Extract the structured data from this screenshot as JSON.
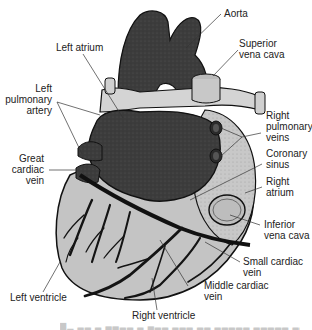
{
  "diagram": {
    "colors": {
      "dark_chamber": "#3c3c3c",
      "vessel_light": "#c9c9c9",
      "ventricle_fill": "#c4c4c4",
      "vein_dark": "#141414",
      "leader_line": "#333333",
      "background": "#ffffff"
    },
    "labels": {
      "aorta": "Aorta",
      "superior_vena_cava_1": "Superior",
      "superior_vena_cava_2": "vena cava",
      "left_atrium": "Left atrium",
      "left_pulmonary_artery_1": "Left",
      "left_pulmonary_artery_2": "pulmonary",
      "left_pulmonary_artery_3": "artery",
      "right_pulmonary_veins_1": "Right",
      "right_pulmonary_veins_2": "pulmonary",
      "right_pulmonary_veins_3": "veins",
      "great_cardiac_vein_1": "Great",
      "great_cardiac_vein_2": "cardiac",
      "great_cardiac_vein_3": "vein",
      "coronary_sinus_1": "Coronary",
      "coronary_sinus_2": "sinus",
      "right_atrium_1": "Right",
      "right_atrium_2": "atrium",
      "inferior_vena_cava_1": "Inferior",
      "inferior_vena_cava_2": "vena cava",
      "small_cardiac_vein_1": "Small cardiac",
      "small_cardiac_vein_2": "vein",
      "middle_cardiac_vein_1": "Middle cardiac",
      "middle_cardiac_vein_2": "vein",
      "left_ventricle": "Left ventricle",
      "right_ventricle": "Right ventricle"
    },
    "caption": "▆▁ ▂▂ ▂ ▃▃▂▂ ▂ ▃▂▂ ▂▂▂ ▂▂ ▂▂▂▂▂ ▂▂▂▂▂ ▂▂"
  }
}
